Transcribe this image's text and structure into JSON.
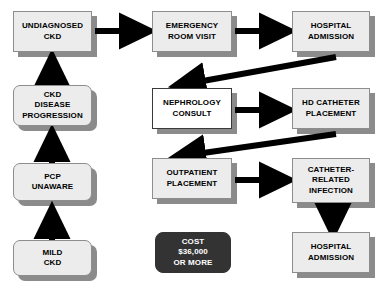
{
  "diagram": {
    "colors": {
      "node_fill": "#ececec",
      "node_fill_white": "#ffffff",
      "node_border": "#8d8d8d",
      "shadow": "#8b8b8b",
      "cost_fill": "#333333",
      "cost_text": "#ffffff",
      "arrow": "#000000",
      "background": "#ffffff"
    },
    "nodes": [
      {
        "id": "undiagnosed-ckd",
        "label": "UNDIAGNOSED\nCKD"
      },
      {
        "id": "emergency-room-visit",
        "label": "EMERGENCY\nROOM VISIT"
      },
      {
        "id": "hospital-admission-top",
        "label": "HOSPITAL\nADMISSION"
      },
      {
        "id": "ckd-disease-progression",
        "label": "CKD\nDISEASE\nPROGRESSION"
      },
      {
        "id": "nephrology-consult",
        "label": "NEPHROLOGY\nCONSULT"
      },
      {
        "id": "hd-catheter-placement",
        "label": "HD CATHETER\nPLACEMENT"
      },
      {
        "id": "pcp-unaware",
        "label": "PCP\nUNAWARE"
      },
      {
        "id": "outpatient-placement",
        "label": "OUTPATIENT\nPLACEMENT"
      },
      {
        "id": "catheter-related-infection",
        "label": "CATHETER-\nRELATED\nINFECTION"
      },
      {
        "id": "mild-ckd",
        "label": "MILD\nCKD"
      },
      {
        "id": "cost-callout",
        "label": "COST\n$36,000\nOR MORE"
      },
      {
        "id": "hospital-admission-bottom",
        "label": "HOSPITAL\nADMISSION"
      }
    ],
    "edges": [
      {
        "id": "mild-ckd-to-pcp-unaware",
        "from": "mild-ckd",
        "to": "pcp-unaware",
        "direction": "up"
      },
      {
        "id": "pcp-unaware-to-ckd-disease-progression",
        "from": "pcp-unaware",
        "to": "ckd-disease-progression",
        "direction": "up"
      },
      {
        "id": "ckd-disease-progression-to-undiagnosed-ckd",
        "from": "ckd-disease-progression",
        "to": "undiagnosed-ckd",
        "direction": "up"
      },
      {
        "id": "undiagnosed-ckd-to-emergency-room-visit",
        "from": "undiagnosed-ckd",
        "to": "emergency-room-visit",
        "direction": "right"
      },
      {
        "id": "emergency-room-visit-to-hospital-admission",
        "from": "emergency-room-visit",
        "to": "hospital-admission-top",
        "direction": "right"
      },
      {
        "id": "hospital-admission-to-nephrology-consult",
        "from": "hospital-admission-top",
        "to": "nephrology-consult",
        "direction": "diagonal-down-left"
      },
      {
        "id": "nephrology-consult-to-hd-catheter-placement",
        "from": "nephrology-consult",
        "to": "hd-catheter-placement",
        "direction": "right"
      },
      {
        "id": "hd-catheter-placement-to-outpatient-placement",
        "from": "hd-catheter-placement",
        "to": "outpatient-placement",
        "direction": "diagonal-down-left"
      },
      {
        "id": "outpatient-placement-to-catheter-related-infection",
        "from": "outpatient-placement",
        "to": "catheter-related-infection",
        "direction": "right"
      },
      {
        "id": "catheter-related-infection-to-hospital-admission",
        "from": "catheter-related-infection",
        "to": "hospital-admission-bottom",
        "direction": "down"
      }
    ]
  }
}
